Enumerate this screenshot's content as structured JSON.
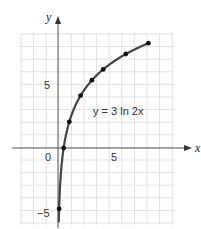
{
  "chart_data": {
    "type": "line",
    "title": "",
    "equation_label": "y = 3 ln 2x",
    "xlabel": "x",
    "ylabel": "y",
    "x_ticks": [
      "0",
      "5"
    ],
    "y_ticks": [
      "5",
      "−5"
    ],
    "xlim": [
      -3,
      10
    ],
    "ylim": [
      -6,
      9
    ],
    "grid": true,
    "series": [
      {
        "name": "y = 3 ln 2x",
        "points": [
          {
            "x": 0.1,
            "y": -4.83
          },
          {
            "x": 0.5,
            "y": 0
          },
          {
            "x": 1,
            "y": 2.08
          },
          {
            "x": 2,
            "y": 4.16
          },
          {
            "x": 3,
            "y": 5.38
          },
          {
            "x": 4,
            "y": 6.24
          },
          {
            "x": 6,
            "y": 7.46
          },
          {
            "x": 8,
            "y": 8.32
          }
        ]
      }
    ]
  },
  "labels": {
    "x_axis": "x",
    "y_axis": "y",
    "origin": "0",
    "x_five": "5",
    "y_five": "5",
    "y_neg_five": "−5",
    "equation": "y = 3 ln 2x"
  }
}
